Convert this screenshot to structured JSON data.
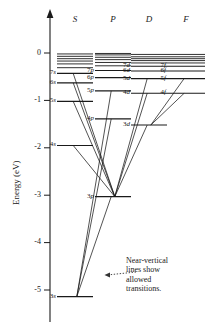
{
  "chart_data": {
    "type": "diagram",
    "title": "",
    "ylabel": "Energy (eV)",
    "xlabel": "",
    "ylim": [
      -5.4,
      0.35
    ],
    "grid": false,
    "legend": null,
    "column_headers": [
      "S",
      "P",
      "D",
      "F"
    ],
    "yticks": [
      0,
      -1,
      -2,
      -3,
      -4,
      -5
    ],
    "ytick_labels": [
      "0",
      "-1",
      "-2",
      "-3",
      "-4",
      "-5"
    ],
    "series": [
      {
        "name": "S",
        "column": 0,
        "levels": [
          {
            "label": "3s",
            "n": "3",
            "l": "s",
            "energy": -5.14,
            "labeled": true
          },
          {
            "label": "4s",
            "n": "4",
            "l": "s",
            "energy": -1.95,
            "labeled": true
          },
          {
            "label": "5s",
            "n": "5",
            "l": "s",
            "energy": -1.02,
            "labeled": true
          },
          {
            "label": "6s",
            "n": "6",
            "l": "s",
            "energy": -0.63,
            "labeled": true
          },
          {
            "label": "7s",
            "n": "7",
            "l": "s",
            "energy": -0.43,
            "labeled": true
          },
          {
            "label": "",
            "n": "",
            "l": "",
            "energy": -0.31,
            "labeled": false
          },
          {
            "label": "",
            "n": "",
            "l": "",
            "energy": -0.23,
            "labeled": false
          },
          {
            "label": "",
            "n": "",
            "l": "",
            "energy": -0.17,
            "labeled": false
          },
          {
            "label": "",
            "n": "",
            "l": "",
            "energy": -0.12,
            "labeled": false
          },
          {
            "label": "",
            "n": "",
            "l": "",
            "energy": -0.07,
            "labeled": false
          },
          {
            "label": "",
            "n": "",
            "l": "",
            "energy": -0.02,
            "labeled": false
          }
        ]
      },
      {
        "name": "P",
        "column": 1,
        "levels": [
          {
            "label": "3p",
            "n": "3",
            "l": "p",
            "energy": -3.03,
            "labeled": true
          },
          {
            "label": "4p",
            "n": "4",
            "l": "p",
            "energy": -1.39,
            "labeled": true
          },
          {
            "label": "5p",
            "n": "5",
            "l": "p",
            "energy": -0.8,
            "labeled": true
          },
          {
            "label": "6p",
            "n": "6",
            "l": "p",
            "energy": -0.52,
            "labeled": true
          },
          {
            "label": "7p",
            "n": "7",
            "l": "p",
            "energy": -0.37,
            "labeled": true
          },
          {
            "label": "",
            "n": "",
            "l": "",
            "energy": -0.27,
            "labeled": false
          },
          {
            "label": "",
            "n": "",
            "l": "",
            "energy": -0.2,
            "labeled": false
          },
          {
            "label": "",
            "n": "",
            "l": "",
            "energy": -0.14,
            "labeled": false
          },
          {
            "label": "",
            "n": "",
            "l": "",
            "energy": -0.09,
            "labeled": false
          },
          {
            "label": "",
            "n": "",
            "l": "",
            "energy": -0.04,
            "labeled": false
          },
          {
            "label": "",
            "n": "",
            "l": "",
            "energy": -0.01,
            "labeled": false
          }
        ]
      },
      {
        "name": "D",
        "column": 2,
        "levels": [
          {
            "label": "3d",
            "n": "3",
            "l": "d",
            "energy": -1.52,
            "labeled": true
          },
          {
            "label": "4d",
            "n": "4",
            "l": "d",
            "energy": -0.85,
            "labeled": true
          },
          {
            "label": "5d",
            "n": "5",
            "l": "d",
            "energy": -0.54,
            "labeled": true
          },
          {
            "label": "6d",
            "n": "6",
            "l": "d",
            "energy": -0.38,
            "labeled": true
          },
          {
            "label": "7d",
            "n": "7",
            "l": "d",
            "energy": -0.28,
            "labeled": true
          },
          {
            "label": "",
            "n": "",
            "l": "",
            "energy": -0.21,
            "labeled": false
          },
          {
            "label": "",
            "n": "",
            "l": "",
            "energy": -0.16,
            "labeled": false
          },
          {
            "label": "",
            "n": "",
            "l": "",
            "energy": -0.12,
            "labeled": false
          },
          {
            "label": "",
            "n": "",
            "l": "",
            "energy": -0.08,
            "labeled": false
          },
          {
            "label": "",
            "n": "",
            "l": "",
            "energy": -0.03,
            "labeled": false
          }
        ]
      },
      {
        "name": "F",
        "column": 3,
        "levels": [
          {
            "label": "4f",
            "n": "4",
            "l": "f",
            "energy": -0.85,
            "labeled": true
          },
          {
            "label": "5f",
            "n": "5",
            "l": "f",
            "energy": -0.54,
            "labeled": true
          },
          {
            "label": "6f",
            "n": "6",
            "l": "f",
            "energy": -0.38,
            "labeled": true
          },
          {
            "label": "7f",
            "n": "7",
            "l": "f",
            "energy": -0.28,
            "labeled": true
          },
          {
            "label": "",
            "n": "",
            "l": "",
            "energy": -0.21,
            "labeled": false
          },
          {
            "label": "",
            "n": "",
            "l": "",
            "energy": -0.16,
            "labeled": false
          },
          {
            "label": "",
            "n": "",
            "l": "",
            "energy": -0.12,
            "labeled": false
          },
          {
            "label": "",
            "n": "",
            "l": "",
            "energy": -0.08,
            "labeled": false
          },
          {
            "label": "",
            "n": "",
            "l": "",
            "energy": -0.03,
            "labeled": false
          }
        ]
      }
    ],
    "transitions": [
      {
        "from": [
          "S",
          "3s"
        ],
        "to": [
          "P",
          "3p"
        ]
      },
      {
        "from": [
          "S",
          "3s"
        ],
        "to": [
          "P",
          "4p"
        ]
      },
      {
        "from": [
          "S",
          "3s"
        ],
        "to": [
          "P",
          "5p"
        ]
      },
      {
        "from": [
          "P",
          "3p"
        ],
        "to": [
          "S",
          "4s"
        ]
      },
      {
        "from": [
          "P",
          "3p"
        ],
        "to": [
          "S",
          "5s"
        ]
      },
      {
        "from": [
          "P",
          "3p"
        ],
        "to": [
          "S",
          "6s"
        ]
      },
      {
        "from": [
          "P",
          "3p"
        ],
        "to": [
          "S",
          "7s"
        ]
      },
      {
        "from": [
          "P",
          "3p"
        ],
        "to": [
          "D",
          "3d"
        ]
      },
      {
        "from": [
          "P",
          "3p"
        ],
        "to": [
          "D",
          "4d"
        ]
      },
      {
        "from": [
          "P",
          "3p"
        ],
        "to": [
          "D",
          "5d"
        ]
      },
      {
        "from": [
          "D",
          "3d"
        ],
        "to": [
          "F",
          "4f"
        ]
      },
      {
        "from": [
          "D",
          "3d"
        ],
        "to": [
          "F",
          "5f"
        ]
      }
    ]
  },
  "annotation": {
    "line1": "Near-vertical",
    "line2": "lines show",
    "line3": "allowed",
    "line4": "transitions."
  }
}
